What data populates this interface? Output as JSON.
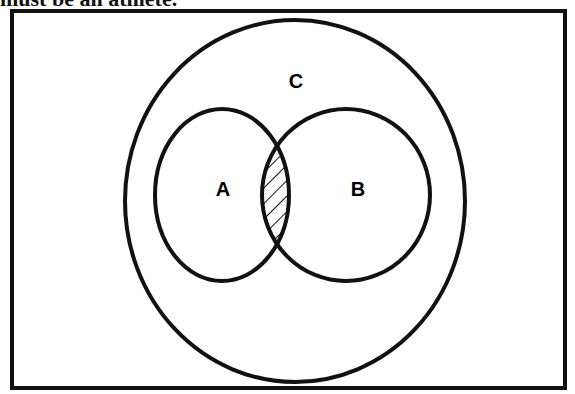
{
  "caption": "must be an athlete.",
  "diagram": {
    "type": "venn",
    "sets": [
      {
        "label": "C",
        "role": "outer universe circle"
      },
      {
        "label": "A",
        "role": "left circle"
      },
      {
        "label": "B",
        "role": "right circle"
      }
    ],
    "shaded_region": "A ∩ B",
    "shading_style": "diagonal hatch"
  }
}
